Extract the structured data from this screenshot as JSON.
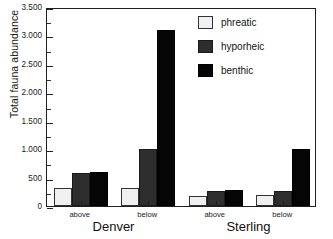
{
  "chart_data": {
    "type": "bar",
    "title": "",
    "xlabel": "",
    "ylabel": "Total fauna abundance",
    "ylim": [
      0,
      3500
    ],
    "ytick_labels": [
      "0",
      "500",
      "1.000",
      "1.500",
      "2.000",
      "2.500",
      "3.000",
      "3.500"
    ],
    "ytick_values": [
      0,
      500,
      1000,
      1500,
      2000,
      2500,
      3000,
      3500
    ],
    "grid": false,
    "legend_position": "top-right",
    "categories": [
      "above",
      "below",
      "above",
      "below"
    ],
    "groups": [
      {
        "name": "Denver",
        "categories": [
          "above",
          "below"
        ]
      },
      {
        "name": "Sterling",
        "categories": [
          "above",
          "below"
        ]
      }
    ],
    "series": [
      {
        "name": "phreatic",
        "color": "#f0f0f0",
        "values": [
          310,
          320,
          175,
          200
        ]
      },
      {
        "name": "hyporheic",
        "color": "#2e2e2e",
        "values": [
          580,
          1000,
          265,
          270
        ]
      },
      {
        "name": "benthic",
        "color": "#050505",
        "values": [
          600,
          3100,
          285,
          1000
        ]
      }
    ]
  },
  "legend": {
    "items": [
      {
        "label": "phreatic"
      },
      {
        "label": "hyporheic"
      },
      {
        "label": "benthic"
      }
    ]
  },
  "axes": {
    "y_title": "Total fauna abundance"
  }
}
